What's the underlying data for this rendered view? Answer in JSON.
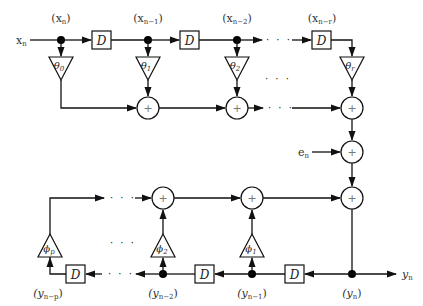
{
  "diagram": {
    "input": {
      "label": "x",
      "sub": "n"
    },
    "error_input": {
      "label": "e",
      "sub": "n"
    },
    "output": {
      "label": "y",
      "sub": "n"
    },
    "delay_label": "D",
    "sum_symbol": "+",
    "ellipsis": "· · ·",
    "top_taps": [
      {
        "name": "(x",
        "sub": "n",
        "close": ")",
        "coef": "θ",
        "coef_sub": "0"
      },
      {
        "name": "(x",
        "sub": "n−1",
        "close": ")",
        "coef": "θ",
        "coef_sub": "1"
      },
      {
        "name": "(x",
        "sub": "n−2",
        "close": ")",
        "coef": "θ",
        "coef_sub": "2"
      },
      {
        "name": "(x",
        "sub": "n−r",
        "close": ")",
        "coef": "θ",
        "coef_sub": "r"
      }
    ],
    "bottom_taps": [
      {
        "name": "(y",
        "sub": "n",
        "close": ")"
      },
      {
        "name": "(y",
        "sub": "n−1",
        "close": ")",
        "coef": "ϕ",
        "coef_sub": "1"
      },
      {
        "name": "(y",
        "sub": "n−2",
        "close": ")",
        "coef": "ϕ",
        "coef_sub": "2"
      },
      {
        "name": "(y",
        "sub": "n−p",
        "close": ")",
        "coef": "ϕ",
        "coef_sub": "p"
      }
    ]
  }
}
